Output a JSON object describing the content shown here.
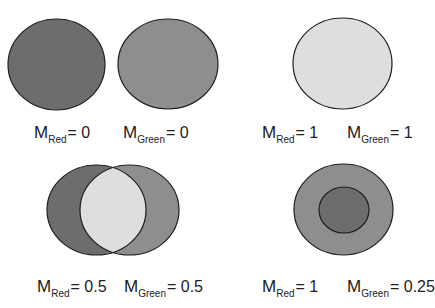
{
  "colors": {
    "dark": "#6d6d6d",
    "medium": "#8e8e8e",
    "light": "#dedede",
    "stroke": "#1e1e1e"
  },
  "panels": [
    {
      "id": "top-left",
      "description": "Two separate circles, no overlap",
      "labels": [
        {
          "symbol": "M",
          "subscript": "Red",
          "value": "= 0"
        },
        {
          "symbol": "M",
          "subscript": "Green",
          "value": "= 0"
        }
      ]
    },
    {
      "id": "top-right",
      "description": "Two circles fully coincident",
      "labels": [
        {
          "symbol": "M",
          "subscript": "Red",
          "value": "= 1"
        },
        {
          "symbol": "M",
          "subscript": "Green",
          "value": "= 1"
        }
      ]
    },
    {
      "id": "bottom-left",
      "description": "Two circles partially overlapping",
      "labels": [
        {
          "symbol": "M",
          "subscript": "Red",
          "value": "= 0.5"
        },
        {
          "symbol": "M",
          "subscript": "Green",
          "value": "= 0.5"
        }
      ]
    },
    {
      "id": "bottom-right",
      "description": "Small circle inside larger circle",
      "labels": [
        {
          "symbol": "M",
          "subscript": "Red",
          "value": "= 1"
        },
        {
          "symbol": "M",
          "subscript": "Green",
          "value": "= 0.25"
        }
      ]
    }
  ]
}
